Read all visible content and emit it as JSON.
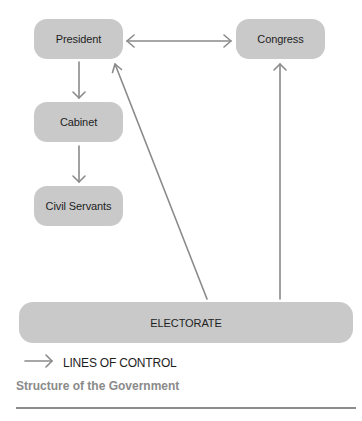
{
  "diagram": {
    "nodes": {
      "president": {
        "label": "President"
      },
      "congress": {
        "label": "Congress"
      },
      "cabinet": {
        "label": "Cabinet"
      },
      "civil_servants": {
        "label": "Civil Servants"
      },
      "electorate": {
        "label": "ELECTORATE"
      }
    },
    "edges": [
      {
        "from": "President",
        "to": "Congress",
        "type": "bidirectional"
      },
      {
        "from": "President",
        "to": "Cabinet",
        "type": "directed"
      },
      {
        "from": "Cabinet",
        "to": "Civil Servants",
        "type": "directed"
      },
      {
        "from": "ELECTORATE",
        "to": "President",
        "type": "directed"
      },
      {
        "from": "ELECTORATE",
        "to": "Congress",
        "type": "directed"
      }
    ],
    "legend": {
      "label": "LINES OF CONTROL",
      "icon": "arrow-right-icon"
    },
    "caption": "Structure of the Government",
    "colors": {
      "node_fill": "#c9c9c9",
      "arrow": "#8a8a8a",
      "caption": "#8a8a8a",
      "rule": "#8c8c8c"
    }
  }
}
